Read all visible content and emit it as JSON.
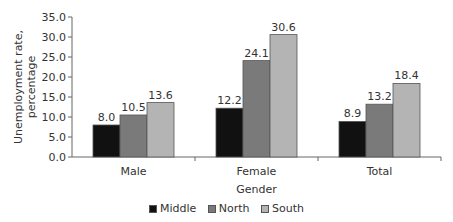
{
  "chart_data": {
    "type": "bar",
    "title": "",
    "xlabel": "Gender",
    "ylabel": "Unemployment rate, percentage",
    "ylabel_lines": [
      "Unemployment rate,",
      "percentage"
    ],
    "categories": [
      "Male",
      "Female",
      "Total"
    ],
    "series": [
      {
        "name": "Middle",
        "values": [
          8.0,
          12.2,
          8.9
        ],
        "color": "#111111"
      },
      {
        "name": "North",
        "values": [
          10.5,
          24.1,
          13.2
        ],
        "color": "#7a7a7a"
      },
      {
        "name": "South",
        "values": [
          13.6,
          30.6,
          18.4
        ],
        "color": "#b4b4b4"
      }
    ],
    "value_labels": [
      [
        "8.0",
        "12.2",
        "8.9"
      ],
      [
        "10.5",
        "24.1",
        "13.2"
      ],
      [
        "13.6",
        "30.6",
        "18.4"
      ]
    ],
    "ylim": [
      0,
      35
    ],
    "yticks": [
      "0.0",
      "5.0",
      "10.0",
      "15.0",
      "20.0",
      "25.0",
      "30.0",
      "35.0"
    ],
    "grid": false,
    "legend_position": "bottom"
  }
}
